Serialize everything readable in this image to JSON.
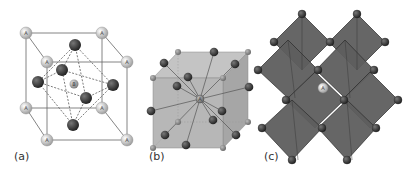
{
  "panels": [
    {
      "label": "(a)",
      "description": "Cubic perovskite ABO3 unit cell with A at corners, B at body center, O octahedron"
    },
    {
      "label": "(b)",
      "description": "Cube centered on B-site atom with bonds to surrounding atoms"
    },
    {
      "label": "(c)",
      "description": "Corner-sharing BO6 octahedra network with A cation in cavity"
    }
  ],
  "atoms": {
    "a_site": "A",
    "b_site": "B",
    "o_site": "O"
  },
  "colors": {
    "a_atom": "#d8d8d8",
    "b_atom": "#a8a8a8",
    "o_atom": "#3a3a3a",
    "cube_face": "#b5b5b5",
    "octahedron": "#5a5a5a",
    "line": "#555555"
  }
}
